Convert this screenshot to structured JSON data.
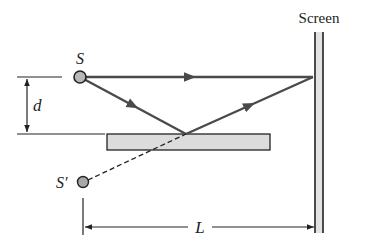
{
  "diagram": {
    "type": "lloyds-mirror-interference",
    "labels": {
      "source": "S",
      "image_source": "S′",
      "separation": "d",
      "distance": "L",
      "screen": "Screen"
    },
    "colors": {
      "ray": "#4a4a4a",
      "outline": "#222222",
      "source_fill": "#b8b8b8",
      "mirror_fill": "#dcdcdc",
      "screen_fill": "#e2e2e2",
      "background": "#ffffff"
    }
  }
}
